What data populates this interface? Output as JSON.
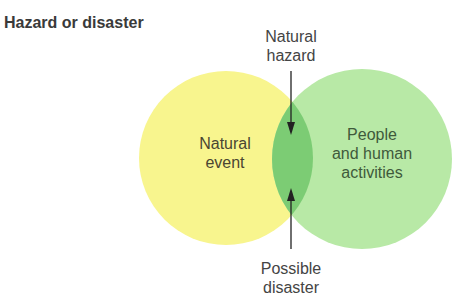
{
  "title": "Hazard or disaster",
  "circles": {
    "left": {
      "label_line1": "Natural",
      "label_line2": "event",
      "color": "#f8f58e"
    },
    "right": {
      "label_line1": "People",
      "label_line2": "and human",
      "label_line3": "activities",
      "color": "#b8e9a6"
    },
    "overlap_color": "#7ccc74"
  },
  "annotations": {
    "top": {
      "line1": "Natural",
      "line2": "hazard"
    },
    "bottom": {
      "line1": "Possible",
      "line2": "disaster"
    }
  }
}
